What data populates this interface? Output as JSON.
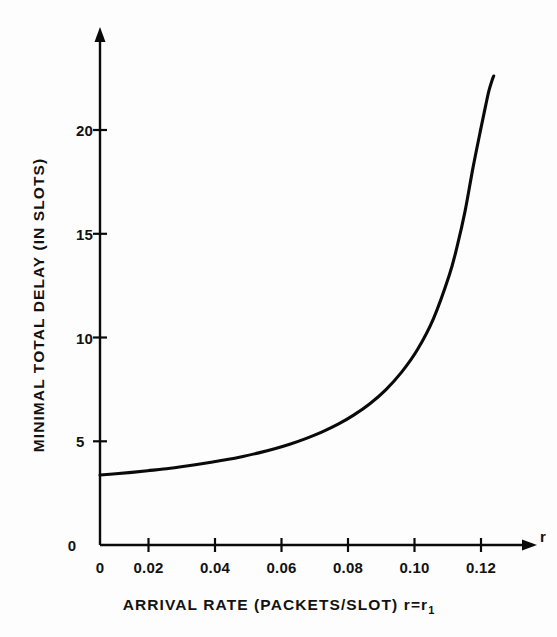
{
  "figure": {
    "background_color": "#fdfdfd",
    "ink_color": "#0a0a0a"
  },
  "axes": {
    "x_axis_variable_label": "r",
    "x_axis_title_main": "ARRIVAL RATE (PACKETS/SLOT)  r=r",
    "x_axis_title_subscript": "1",
    "y_axis_title": "MINIMAL  TOTAL  DELAY  (IN SLOTS)",
    "x_tick_labels": [
      "0",
      "0.02",
      "0.04",
      "0.06",
      "0.08",
      "0.10",
      "0.12"
    ],
    "y_tick_labels": [
      "0",
      "5",
      "10",
      "15",
      "20"
    ],
    "y_origin_label": "0"
  },
  "chart_data": {
    "type": "line",
    "title": "",
    "subtitle": "",
    "xlabel": "ARRIVAL RATE (PACKETS/SLOT) r=r1",
    "ylabel": "MINIMAL TOTAL DELAY (IN SLOTS)",
    "xlim": [
      0,
      0.1305
    ],
    "ylim": [
      0,
      23.2
    ],
    "xticks": [
      0,
      0.02,
      0.04,
      0.06,
      0.08,
      0.1,
      0.12
    ],
    "yticks": [
      0,
      5,
      10,
      15,
      20
    ],
    "xticklabels": [
      "0",
      "0.02",
      "0.04",
      "0.06",
      "0.08",
      "0.10",
      "0.12"
    ],
    "yticklabels": [
      "0",
      "5",
      "10",
      "15",
      "20"
    ],
    "grid": false,
    "legend": false,
    "legend_position": "none",
    "axis_style": "arrow-ended open axes (left spine and bottom spine only)",
    "annotations": [
      "x-axis terminates in arrowhead labelled r",
      "y-axis terminates in upward arrowhead",
      "curve diverges asymptotically near r = 0.125"
    ],
    "series": [
      {
        "name": "minimal total delay",
        "x": [
          0.0,
          0.005,
          0.01,
          0.015,
          0.02,
          0.025,
          0.03,
          0.035,
          0.04,
          0.045,
          0.05,
          0.055,
          0.06,
          0.065,
          0.07,
          0.075,
          0.08,
          0.085,
          0.09,
          0.095,
          0.1,
          0.105,
          0.11,
          0.1125,
          0.115,
          0.1175,
          0.12,
          0.1215,
          0.1225,
          0.1235,
          0.124
        ],
        "y": [
          3.37,
          3.43,
          3.5,
          3.58,
          3.66,
          3.76,
          3.87,
          3.99,
          4.12,
          4.27,
          4.44,
          4.64,
          4.87,
          5.14,
          5.45,
          5.82,
          6.27,
          6.81,
          7.48,
          8.33,
          9.42,
          10.9,
          13.0,
          14.4,
          16.1,
          18.2,
          20.1,
          21.2,
          21.9,
          22.4,
          22.6
        ]
      }
    ]
  }
}
